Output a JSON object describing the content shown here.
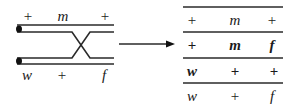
{
  "diagram": {
    "type": "chromosome-crossover",
    "before": {
      "top_chromosome_labels": [
        "+",
        "m",
        "+"
      ],
      "bottom_chromosome_labels": [
        "w",
        "+",
        "f"
      ]
    },
    "arrow": "right-arrow",
    "after_table": {
      "rows": [
        {
          "cells": [
            "+",
            "m",
            "+"
          ],
          "bold": false
        },
        {
          "cells": [
            "+",
            "m",
            "f"
          ],
          "bold": true
        },
        {
          "cells": [
            "w",
            "+",
            "+"
          ],
          "bold": true
        },
        {
          "cells": [
            "w",
            "+",
            "f"
          ],
          "bold": false
        }
      ]
    },
    "colors": {
      "line": "#2a2a2a",
      "background": "#ffffff"
    }
  }
}
